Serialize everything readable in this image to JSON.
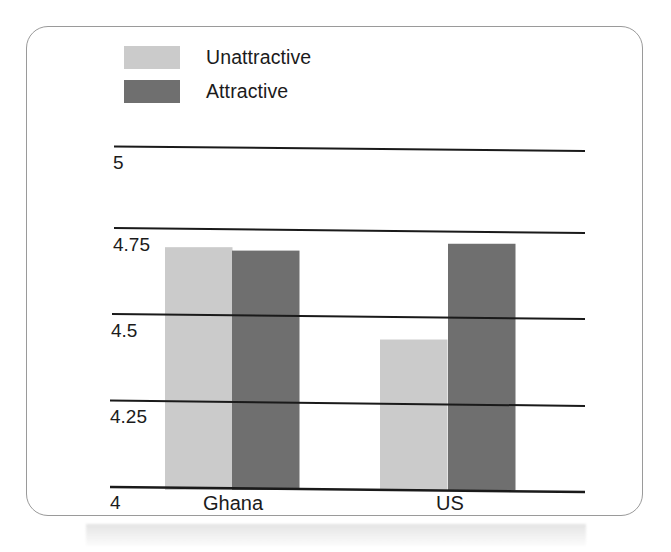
{
  "chart_data": {
    "type": "bar",
    "title": "",
    "subtitle": "",
    "xlabel": "",
    "ylabel": "",
    "categories": [
      "Ghana",
      "US"
    ],
    "series": [
      {
        "name": "Unattractive",
        "color": "#cbcbcb",
        "values": [
          4.71,
          4.44
        ]
      },
      {
        "name": "Attractive",
        "color": "#6f6f6f",
        "values": [
          4.7,
          4.72
        ]
      }
    ],
    "ylim": [
      4,
      5
    ],
    "yticks": [
      "5",
      "4.75",
      "4.5",
      "4.25",
      "4"
    ],
    "ytick_values": [
      5,
      4.75,
      4.5,
      4.25,
      4
    ],
    "grid": true,
    "grid_orientation": "horizontal",
    "legend_position": "top-left",
    "bar_gap_within_group": 0,
    "annotations": []
  },
  "legend": {
    "items": [
      {
        "label": "Unattractive",
        "swatch": "light"
      },
      {
        "label": "Attractive",
        "swatch": "dark"
      }
    ]
  },
  "axis": {
    "y_tick_labels": [
      "5",
      "4.75",
      "4.5",
      "4.25",
      "4"
    ],
    "x_tick_labels": [
      "Ghana",
      "US"
    ]
  },
  "colors": {
    "unattractive": "#cbcbcb",
    "attractive": "#6f6f6f",
    "gridline": "#1a1a1a",
    "card_border": "#9a9a9a",
    "text": "#1b1b1b",
    "background": "#ffffff"
  }
}
